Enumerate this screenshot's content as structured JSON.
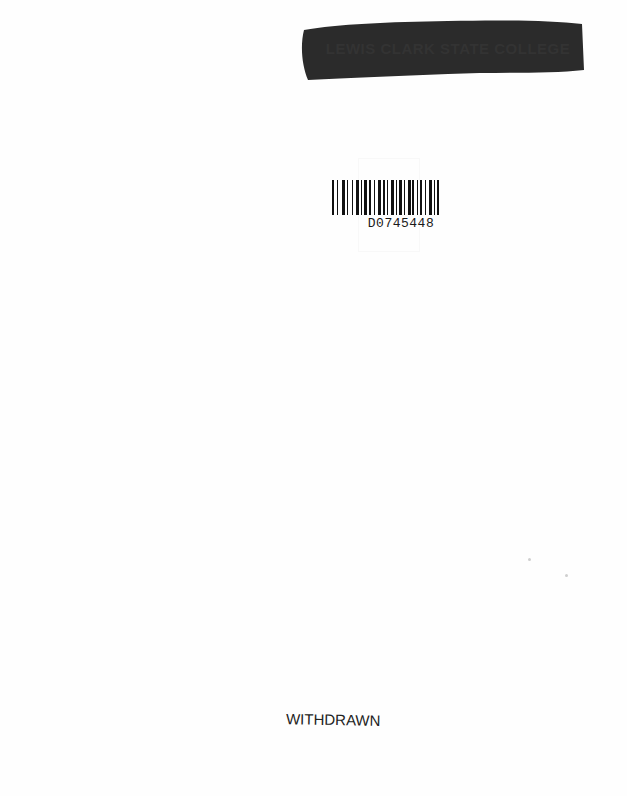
{
  "page": {
    "type": "book endpaper / library stamp page",
    "background_color": "#fefefe"
  },
  "library_stamp": {
    "text": "LEWIS CLARK STATE COLLEGE",
    "state": "blacked out with marker",
    "marker_color": "#2b2b2b"
  },
  "barcode": {
    "number": "D0745448",
    "bar_color": "#111111"
  },
  "withdrawn_stamp": {
    "text": "WITHDRAWN"
  }
}
